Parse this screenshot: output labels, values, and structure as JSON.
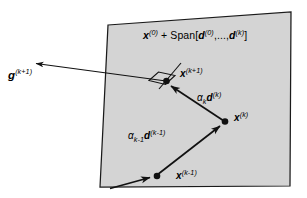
{
  "figure": {
    "background_color": "#ffffff",
    "plane": {
      "name": "affine-subspace-plane",
      "fill_color": "#d4d4d4",
      "stroke_color": "#1a1a1a",
      "corners": [
        [
          108,
          25
        ],
        [
          291,
          12
        ],
        [
          290,
          186
        ],
        [
          100,
          187
        ]
      ],
      "label": "x(0) + Span[d(0),...,d(k)]"
    },
    "labels": {
      "span_plane": {
        "base": "x",
        "sup1": "(0)",
        "plus": " + Span[",
        "base2": "d",
        "sup2": "(0)",
        "mid": ",...,",
        "base3": "d",
        "sup3": "(k)",
        "close": "]"
      },
      "gradient": {
        "base": "g",
        "sup": "(k+1)"
      },
      "point_k_plus_1": {
        "base": "x",
        "sup": "(k+1)"
      },
      "point_k": {
        "base": "x",
        "sup": "(k)"
      },
      "point_k_minus_1": {
        "base": "x",
        "sup": "(k-1)"
      },
      "step_k": {
        "alpha": "α",
        "sub": "k",
        "dir": "d",
        "sup": "(k)"
      },
      "step_k_minus_1": {
        "alpha": "α",
        "sub": "k-1",
        "dir": "d",
        "sup": "(k-1)"
      }
    },
    "points": [
      {
        "name": "x-k-minus-1",
        "x": 157,
        "y": 176
      },
      {
        "name": "x-k",
        "x": 225,
        "y": 122
      },
      {
        "name": "x-k-plus-1",
        "x": 166,
        "y": 81
      }
    ],
    "arrows": [
      {
        "name": "incoming-arrow",
        "from": [
          110,
          188
        ],
        "to": [
          153,
          177
        ]
      },
      {
        "name": "step-k-minus-1-arrow",
        "from": [
          157,
          176
        ],
        "to": [
          223,
          124
        ]
      },
      {
        "name": "step-k-arrow",
        "from": [
          225,
          122
        ],
        "to": [
          169,
          84
        ]
      },
      {
        "name": "gradient-arrow",
        "from": [
          166,
          81
        ],
        "to": [
          33,
          63
        ]
      },
      {
        "name": "tangent-ray",
        "from": [
          160,
          88
        ],
        "to": [
          180,
          64
        ]
      }
    ],
    "right_angle_marker": {
      "name": "perpendicular-marker",
      "vertices": [
        [
          148,
          80
        ],
        [
          158,
          72
        ],
        [
          176,
          75
        ],
        [
          166,
          85
        ]
      ]
    },
    "stroke_color": "#111111",
    "text_color": "#000000"
  }
}
